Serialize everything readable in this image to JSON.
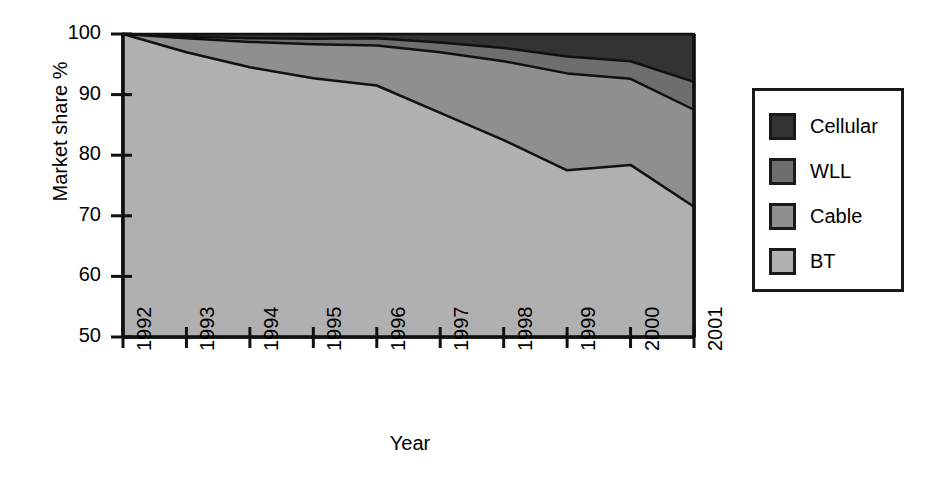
{
  "chart_data": {
    "type": "area",
    "stacked": true,
    "title": "",
    "xlabel": "Year",
    "ylabel": "Market share %",
    "categories": [
      "1992",
      "1993",
      "1994",
      "1995",
      "1996",
      "1997",
      "1998",
      "1999",
      "2000",
      "2001"
    ],
    "x": [
      1992,
      1993,
      1994,
      1995,
      1996,
      1997,
      1998,
      1999,
      2000,
      2001
    ],
    "xlim": [
      1992,
      2001
    ],
    "ylim": [
      50,
      100
    ],
    "yticks": [
      50,
      60,
      70,
      80,
      90,
      100
    ],
    "grid": false,
    "legend_position": "right",
    "stack_order_bottom_to_top": [
      "BT",
      "Cable",
      "WLL",
      "Cellular"
    ],
    "series": [
      {
        "name": "BT",
        "color": "#b0b0b0",
        "values": [
          100.0,
          97.0,
          94.5,
          92.7,
          91.5,
          87.0,
          82.5,
          77.5,
          78.4,
          71.5
        ]
      },
      {
        "name": "Cable",
        "color": "#8f8f8f",
        "values": [
          0.0,
          2.3,
          4.2,
          5.6,
          6.6,
          10.0,
          13.0,
          16.0,
          14.2,
          16.0
        ]
      },
      {
        "name": "WLL",
        "color": "#6e6e6e",
        "values": [
          0.0,
          0.3,
          0.6,
          0.9,
          1.2,
          1.6,
          2.2,
          2.8,
          2.9,
          4.6
        ]
      },
      {
        "name": "Cellular",
        "color": "#333333",
        "values": [
          0.0,
          0.4,
          0.7,
          0.8,
          0.7,
          1.4,
          2.3,
          3.7,
          4.5,
          7.9
        ]
      }
    ],
    "cumulative_top_boundaries": {
      "BT_top": [
        100.0,
        97.0,
        94.5,
        92.7,
        91.5,
        87.0,
        82.5,
        77.5,
        78.4,
        71.5
      ],
      "Cable_top": [
        100.0,
        99.3,
        98.7,
        98.3,
        98.1,
        97.0,
        95.5,
        93.5,
        92.6,
        87.5
      ],
      "WLL_top": [
        100.0,
        99.6,
        99.3,
        99.2,
        99.3,
        98.6,
        97.7,
        96.3,
        95.5,
        92.1
      ],
      "Cellular_top": [
        100.0,
        100.0,
        100.0,
        100.0,
        100.0,
        100.0,
        100.0,
        100.0,
        100.0,
        100.0
      ]
    }
  },
  "legend": {
    "items": [
      {
        "label": "Cellular",
        "color": "#333333"
      },
      {
        "label": "WLL",
        "color": "#6e6e6e"
      },
      {
        "label": "Cable",
        "color": "#8f8f8f"
      },
      {
        "label": "BT",
        "color": "#b0b0b0"
      }
    ]
  },
  "axes": {
    "y_tick_labels": [
      "100",
      "90",
      "80",
      "70",
      "60",
      "50"
    ],
    "x_tick_labels": [
      "1992",
      "1993",
      "1994",
      "1995",
      "1996",
      "1997",
      "1998",
      "1999",
      "2000",
      "2001"
    ],
    "y_axis_title": "Market share %",
    "x_axis_title": "Year"
  }
}
